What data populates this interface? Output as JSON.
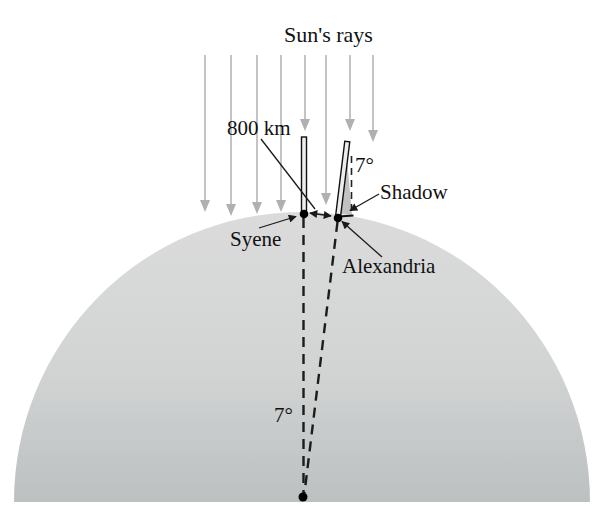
{
  "figure": {
    "title": "Sun's rays",
    "labels": {
      "distance": "800 km",
      "angle_shadow": "7°",
      "shadow": "Shadow",
      "syene": "Syene",
      "alexandria": "Alexandria",
      "angle_center": "7°"
    },
    "colors": {
      "background": "#ffffff",
      "ray_line": "#c4c4c4",
      "ray_arrow": "#b0b0b0",
      "earth_top": "#dbdbdb",
      "earth_bottom": "#bcc0c0",
      "ink": "#111111"
    }
  }
}
